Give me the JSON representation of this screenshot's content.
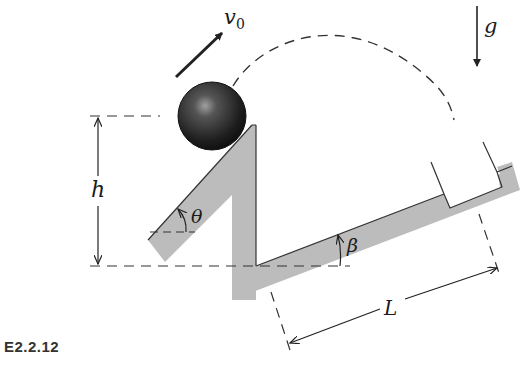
{
  "figure": {
    "caption": "E2.2.12",
    "labels": {
      "initial_velocity": "v",
      "initial_velocity_sub": "0",
      "gravity": "g",
      "height": "h",
      "launch_angle": "θ",
      "incline_angle": "β",
      "distance": "L"
    },
    "colors": {
      "ramp_fill": "#b9b9b9",
      "ball_dark": "#1c1c1c",
      "ball_highlight": "#9a9a9a",
      "line": "#222222",
      "background": "#ffffff"
    },
    "elements": [
      "ball",
      "launch-ramp",
      "inclined-plane",
      "cup",
      "trajectory-dashed-arc",
      "velocity-arrow",
      "gravity-arrow",
      "height-dimension",
      "distance-dimension",
      "angle-theta",
      "angle-beta"
    ]
  }
}
